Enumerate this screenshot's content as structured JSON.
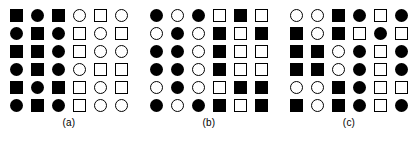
{
  "figure": {
    "type": "shape-grid-figure",
    "colors": {
      "fill": "#000000",
      "stroke": "#000000",
      "background": "#ffffff"
    },
    "grid_rows": 6,
    "grid_cols": 6,
    "shape_legend": {
      "filled-square": "solid black square",
      "open-square": "white square with black outline",
      "filled-circle": "solid black circle",
      "open-circle": "white circle with black outline"
    },
    "panels": [
      {
        "id": "a",
        "caption": "(a)",
        "cells": [
          [
            "filled-square",
            "filled-circle",
            "filled-square",
            "open-circle",
            "open-square",
            "open-circle"
          ],
          [
            "filled-circle",
            "filled-square",
            "filled-circle",
            "open-square",
            "open-circle",
            "open-square"
          ],
          [
            "filled-square",
            "filled-square",
            "filled-circle",
            "open-square",
            "open-circle",
            "open-circle"
          ],
          [
            "filled-circle",
            "filled-square",
            "filled-circle",
            "open-circle",
            "open-square",
            "open-square"
          ],
          [
            "filled-square",
            "filled-circle",
            "filled-square",
            "open-square",
            "open-circle",
            "open-square"
          ],
          [
            "filled-circle",
            "filled-square",
            "filled-circle",
            "open-square",
            "open-circle",
            "open-circle"
          ]
        ]
      },
      {
        "id": "b",
        "caption": "(b)",
        "cells": [
          [
            "filled-circle",
            "open-circle",
            "filled-circle",
            "open-square",
            "filled-square",
            "open-square"
          ],
          [
            "open-circle",
            "filled-circle",
            "open-circle",
            "filled-square",
            "open-square",
            "filled-square"
          ],
          [
            "filled-circle",
            "filled-circle",
            "open-circle",
            "filled-square",
            "open-square",
            "open-square"
          ],
          [
            "filled-circle",
            "filled-circle",
            "open-circle",
            "filled-square",
            "open-square",
            "open-square"
          ],
          [
            "open-circle",
            "filled-circle",
            "open-circle",
            "open-square",
            "filled-square",
            "filled-square"
          ],
          [
            "filled-circle",
            "open-circle",
            "filled-circle",
            "filled-square",
            "open-square",
            "filled-square"
          ]
        ]
      },
      {
        "id": "c",
        "caption": "(c)",
        "cells": [
          [
            "open-circle",
            "open-circle",
            "filled-square",
            "filled-circle",
            "open-square",
            "filled-circle"
          ],
          [
            "filled-square",
            "open-circle",
            "filled-square",
            "open-square",
            "filled-circle",
            "open-square"
          ],
          [
            "filled-square",
            "filled-square",
            "open-circle",
            "filled-circle",
            "open-square",
            "filled-circle"
          ],
          [
            "filled-square",
            "filled-square",
            "open-circle",
            "filled-circle",
            "open-square",
            "filled-circle"
          ],
          [
            "open-circle",
            "open-circle",
            "filled-square",
            "filled-circle",
            "open-square",
            "open-square"
          ],
          [
            "filled-square",
            "open-circle",
            "filled-square",
            "filled-circle",
            "open-square",
            "filled-circle"
          ]
        ]
      }
    ]
  }
}
